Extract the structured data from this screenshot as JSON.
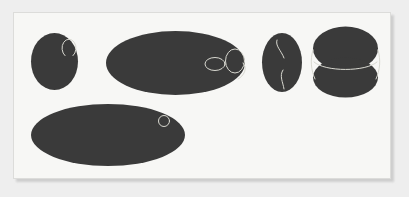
{
  "scene": {
    "title": "",
    "canvas_width": 409,
    "canvas_height": 197,
    "outer_background_color": "#eeeeee",
    "panel_background_color": "#f7f7f5",
    "panel_border_color": "#dcdcda",
    "panel_shadow_color": "#c9c9c9",
    "shape_fill_color": "#3a3a3a",
    "annotation_stroke_color": "#d8d8d0",
    "panel": {
      "x": 13,
      "y": 12,
      "width": 378,
      "height": 167
    }
  },
  "shapes": [
    {
      "id": "blob-1",
      "name": "left-small-ellipse",
      "type": "ellipse",
      "cx": 54.5,
      "cy": 61.5,
      "rx": 23.5,
      "ry": 28.5,
      "rotation": 0,
      "fill": "#3a3a3a"
    },
    {
      "id": "blob-2",
      "name": "center-large-ellipse",
      "type": "ellipse",
      "cx": 175.5,
      "cy": 63,
      "rx": 69.5,
      "ry": 32,
      "rotation": 0,
      "fill": "#3a3a3a"
    },
    {
      "id": "blob-3",
      "name": "narrow-vertical-ellipse",
      "type": "ellipse",
      "cx": 282,
      "cy": 62.5,
      "rx": 20,
      "ry": 29.5,
      "rotation": 0,
      "fill": "#3a3a3a"
    },
    {
      "id": "blob-4",
      "name": "right-top-ellipse",
      "type": "ellipse",
      "cx": 345.5,
      "cy": 48.5,
      "rx": 32.5,
      "ry": 22,
      "rotation": 0,
      "fill": "#3a3a3a"
    },
    {
      "id": "blob-5",
      "name": "right-bottom-ellipse",
      "type": "ellipse",
      "cx": 345.5,
      "cy": 77.5,
      "rx": 32.5,
      "ry": 20,
      "rotation": 0,
      "fill": "#3a3a3a"
    },
    {
      "id": "blob-6",
      "name": "bottom-wide-ellipse",
      "type": "ellipse",
      "cx": 108,
      "cy": 135,
      "rx": 77,
      "ry": 31,
      "rotation": 0,
      "fill": "#3a3a3a"
    }
  ],
  "annotations": [
    {
      "id": "ann-1",
      "name": "c-arc-on-left-ellipse",
      "type": "arc",
      "cx": 69,
      "cy": 63,
      "rx": 7,
      "ry": 9,
      "stroke": "#d8d8d0",
      "stroke_width": 1
    },
    {
      "id": "ann-2",
      "name": "small-horizontal-ring-on-center-ellipse",
      "type": "ellipse-outline",
      "cx": 215,
      "cy": 64,
      "rx": 10,
      "ry": 6.5,
      "stroke": "#d8d8d0",
      "stroke_width": 1
    },
    {
      "id": "ann-3",
      "name": "vertical-ring-on-center-ellipse",
      "type": "ellipse-outline",
      "cx": 235,
      "cy": 61,
      "rx": 9.5,
      "ry": 12,
      "stroke": "#d8d8d0",
      "stroke_width": 1
    },
    {
      "id": "ann-4",
      "name": "tail-curve-on-center-ellipse",
      "type": "path",
      "d": "M 243 63 C 248 68, 244 76, 238 79",
      "stroke": "#d8d8d0",
      "stroke_width": 1
    },
    {
      "id": "ann-5",
      "name": "upper-squiggle-on-narrow-ellipse",
      "type": "path",
      "d": "M 277 40 C 275 46, 281 50, 284 58",
      "stroke": "#d8d8d0",
      "stroke_width": 1
    },
    {
      "id": "ann-6",
      "name": "lower-squiggle-on-narrow-ellipse",
      "type": "path",
      "d": "M 283 70 C 279 76, 283 82, 284 89",
      "stroke": "#d8d8d0",
      "stroke_width": 1
    },
    {
      "id": "ann-7",
      "name": "left-connector-arc-right-group",
      "type": "path",
      "d": "M 313 50 C 310 60, 311 70, 315 79",
      "stroke": "#d8d8d0",
      "stroke_width": 1
    },
    {
      "id": "ann-8",
      "name": "right-connector-arc-right-group",
      "type": "path",
      "d": "M 378 50 C 381 60, 380 70, 376 79",
      "stroke": "#d8d8d0",
      "stroke_width": 1
    },
    {
      "id": "ann-9",
      "name": "seam-arc-right-group",
      "type": "path",
      "d": "M 314 62 C 325 72, 366 72, 377 62",
      "stroke": "#d8d8d0",
      "stroke_width": 1
    },
    {
      "id": "ann-10",
      "name": "small-ring-on-bottom-ellipse",
      "type": "ellipse-outline",
      "cx": 164,
      "cy": 121,
      "rx": 5.5,
      "ry": 5.5,
      "stroke": "#d8d8d0",
      "stroke_width": 1
    }
  ]
}
